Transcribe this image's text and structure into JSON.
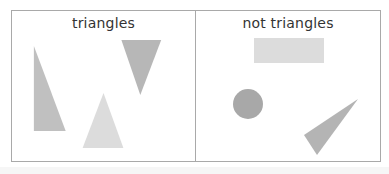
{
  "board": {
    "panels": [
      {
        "title": "triangles",
        "shapes": [
          {
            "kind": "triangle",
            "desc": "tall right triangle",
            "points": "22,35 22,120 54,120",
            "fill": "#c0c0c0"
          },
          {
            "kind": "triangle",
            "desc": "inverted triangle",
            "points": "110,29 150,29 129,84",
            "fill": "#b7b7b7"
          },
          {
            "kind": "triangle",
            "desc": "upright isosceles triangle",
            "points": "92,82 71,137 112,137",
            "fill": "#dcdcdc"
          }
        ]
      },
      {
        "title": "not triangles",
        "shapes": [
          {
            "kind": "rectangle",
            "desc": "rectangle",
            "x": 58,
            "y": 27,
            "w": 70,
            "h": 25,
            "fill": "#dcdcdc"
          },
          {
            "kind": "circle",
            "desc": "circle",
            "cx": 52,
            "cy": 93,
            "r": 15,
            "fill": "#a8a8a8"
          },
          {
            "kind": "triangle",
            "desc": "skinny scalene triangle",
            "points": "162,88 108,124 121,144",
            "fill": "#b4b4b4"
          }
        ]
      }
    ]
  },
  "colors": {
    "border": "#a9a9a9",
    "text": "#333333",
    "background": "#ffffff"
  }
}
